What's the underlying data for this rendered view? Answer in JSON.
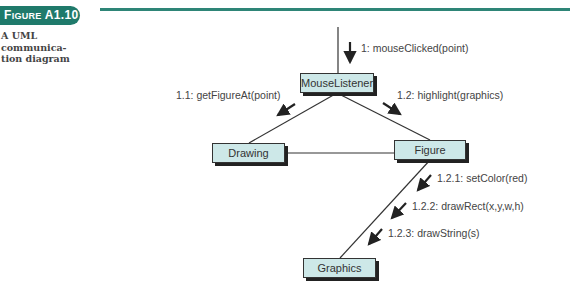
{
  "figure": {
    "badge_prefix": "F",
    "badge_small": "IGURE",
    "badge_number": " A1.10",
    "caption": "A UML communica-tion diagram",
    "accent_color": "#1f7a6b"
  },
  "objects": {
    "mouse_listener": "MouseListener",
    "drawing": "Drawing",
    "figure": "Figure",
    "graphics": "Graphics"
  },
  "messages": {
    "m1": "1: mouseClicked(point)",
    "m1_1": "1.1: getFigureAt(point)",
    "m1_2": "1.2: highlight(graphics)",
    "m1_2_1": "1.2.1: setColor(red)",
    "m1_2_2": "1.2.2: drawRect(x,y,w,h)",
    "m1_2_3": "1.2.3: drawString(s)"
  }
}
